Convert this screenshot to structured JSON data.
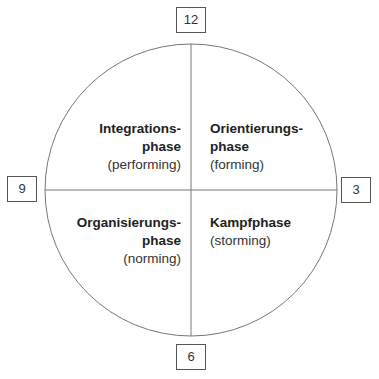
{
  "diagram": {
    "type": "team-development-phases-clock",
    "clock_labels": {
      "top": "12",
      "right": "3",
      "bottom": "6",
      "left": "9"
    },
    "quadrants": [
      {
        "position": "top-left",
        "title_line1": "Integrations-",
        "title_line2": "phase",
        "subtitle": "(performing)"
      },
      {
        "position": "top-right",
        "title_line1": "Orientierungs-",
        "title_line2": "phase",
        "subtitle": "(forming)"
      },
      {
        "position": "bottom-left",
        "title_line1": "Organisierungs-",
        "title_line2": "phase",
        "subtitle": "(norming)"
      },
      {
        "position": "bottom-right",
        "title_line1": "Kampfphase",
        "title_line2": "",
        "subtitle": "(storming)"
      }
    ],
    "colors": {
      "line": "#666666",
      "text": "#222222",
      "background": "#ffffff"
    }
  }
}
